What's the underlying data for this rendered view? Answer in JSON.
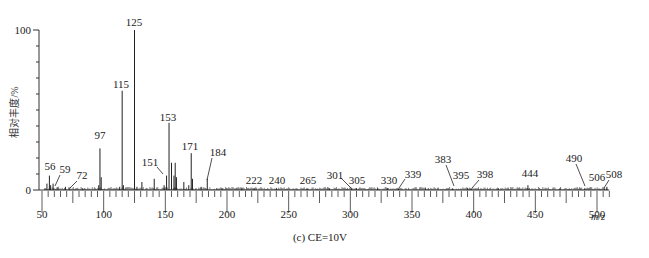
{
  "chart_data": {
    "type": "bar",
    "subtype": "mass-spectrum-stick",
    "title": "",
    "caption": "(c) CE=10V",
    "xlabel": "m/z",
    "ylabel": "相对丰度/%",
    "xlim": [
      50,
      512
    ],
    "ylim": [
      0,
      100
    ],
    "x_ticks": [
      50,
      100,
      150,
      200,
      250,
      300,
      350,
      400,
      450,
      500
    ],
    "y_ticks": [
      0,
      100
    ],
    "grid": false,
    "legend": null,
    "labeled_peaks": [
      {
        "mz": 56,
        "intensity": 9,
        "label": "56"
      },
      {
        "mz": 59,
        "intensity": 4,
        "label": "59"
      },
      {
        "mz": 72,
        "intensity": 1,
        "label": "72"
      },
      {
        "mz": 97,
        "intensity": 26,
        "label": "97"
      },
      {
        "mz": 115,
        "intensity": 62,
        "label": "115"
      },
      {
        "mz": 125,
        "intensity": 100,
        "label": "125"
      },
      {
        "mz": 151,
        "intensity": 9,
        "label": "151"
      },
      {
        "mz": 153,
        "intensity": 42,
        "label": "153"
      },
      {
        "mz": 171,
        "intensity": 23,
        "label": "171"
      },
      {
        "mz": 184,
        "intensity": 7,
        "label": "184"
      },
      {
        "mz": 222,
        "intensity": 1,
        "label": "222"
      },
      {
        "mz": 240,
        "intensity": 1,
        "label": "240"
      },
      {
        "mz": 265,
        "intensity": 1,
        "label": "265"
      },
      {
        "mz": 301,
        "intensity": 1,
        "label": "301"
      },
      {
        "mz": 305,
        "intensity": 1,
        "label": "305"
      },
      {
        "mz": 330,
        "intensity": 1,
        "label": "330"
      },
      {
        "mz": 339,
        "intensity": 1,
        "label": "339"
      },
      {
        "mz": 383,
        "intensity": 1,
        "label": "383"
      },
      {
        "mz": 395,
        "intensity": 1,
        "label": "395"
      },
      {
        "mz": 398,
        "intensity": 1,
        "label": "398"
      },
      {
        "mz": 444,
        "intensity": 3,
        "label": "444"
      },
      {
        "mz": 490,
        "intensity": 1,
        "label": "490"
      },
      {
        "mz": 506,
        "intensity": 1,
        "label": "506"
      },
      {
        "mz": 508,
        "intensity": 2,
        "label": "508"
      }
    ],
    "minor_peaks": [
      {
        "mz": 54,
        "intensity": 4
      },
      {
        "mz": 57,
        "intensity": 3
      },
      {
        "mz": 63,
        "intensity": 2
      },
      {
        "mz": 69,
        "intensity": 2
      },
      {
        "mz": 83,
        "intensity": 1
      },
      {
        "mz": 96,
        "intensity": 3
      },
      {
        "mz": 98,
        "intensity": 8
      },
      {
        "mz": 113,
        "intensity": 2
      },
      {
        "mz": 116,
        "intensity": 3
      },
      {
        "mz": 127,
        "intensity": 2
      },
      {
        "mz": 131,
        "intensity": 5
      },
      {
        "mz": 141,
        "intensity": 7
      },
      {
        "mz": 149,
        "intensity": 3
      },
      {
        "mz": 155,
        "intensity": 17
      },
      {
        "mz": 157,
        "intensity": 9
      },
      {
        "mz": 158,
        "intensity": 17
      },
      {
        "mz": 159,
        "intensity": 8
      },
      {
        "mz": 165,
        "intensity": 5
      },
      {
        "mz": 169,
        "intensity": 3
      },
      {
        "mz": 172,
        "intensity": 7
      },
      {
        "mz": 179,
        "intensity": 2
      },
      {
        "mz": 196,
        "intensity": 1
      },
      {
        "mz": 212,
        "intensity": 1
      },
      {
        "mz": 283,
        "intensity": 1
      },
      {
        "mz": 322,
        "intensity": 1
      },
      {
        "mz": 361,
        "intensity": 1
      },
      {
        "mz": 420,
        "intensity": 1
      },
      {
        "mz": 470,
        "intensity": 1
      }
    ]
  },
  "axes": {
    "x_label": "m/z",
    "y_label": "相对丰度/%",
    "caption": "(c) CE=10V"
  },
  "colors": {
    "line": "#222222",
    "axis": "#333333",
    "background": "#ffffff"
  }
}
